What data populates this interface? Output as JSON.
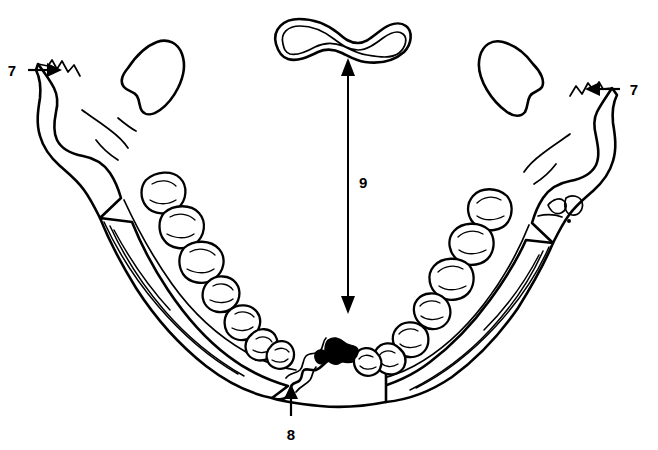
{
  "figure": {
    "background_color": "#ffffff",
    "line_color": "#000000",
    "width": 658,
    "height": 450
  },
  "labels": [
    {
      "id": "label-7-left",
      "text": "7",
      "x": 12,
      "y": 76,
      "pointer": "right",
      "target_structure": "left-coronoid-notch"
    },
    {
      "id": "label-7-right",
      "text": "7",
      "x": 630,
      "y": 95,
      "pointer": "left",
      "target_structure": "right-coronoid-notch"
    },
    {
      "id": "label-8",
      "text": "8",
      "x": 290,
      "y": 434,
      "pointer": "up",
      "target_structure": "mental-symphysis"
    },
    {
      "id": "label-9",
      "text": "9",
      "x": 357,
      "y": 188,
      "pointer": "double-vertical",
      "target_structure": "hyoid-to-mandible-distance"
    }
  ],
  "structures": [
    {
      "id": "hyoid-bone",
      "name": "hyoid bone",
      "description": "curved double-outlined bar at top center"
    },
    {
      "id": "left-ramus",
      "name": "left ramus and condyle",
      "description": "upper left process"
    },
    {
      "id": "right-ramus",
      "name": "right ramus and condyle",
      "description": "upper right process"
    },
    {
      "id": "left-dental-arch",
      "name": "left dental arch",
      "description": "row of molar and premolar crowns"
    },
    {
      "id": "right-dental-arch",
      "name": "right dental arch",
      "description": "row of molar and premolar crowns"
    },
    {
      "id": "mandible-body",
      "name": "mandibular body",
      "description": "U-shaped arch forming the jaw"
    },
    {
      "id": "symphysis",
      "name": "mental symphysis",
      "description": "midline chin notch"
    }
  ],
  "measurements": {
    "vertical_arrow": {
      "label": "9",
      "top_y": 60,
      "bottom_y": 312,
      "x": 348
    }
  }
}
